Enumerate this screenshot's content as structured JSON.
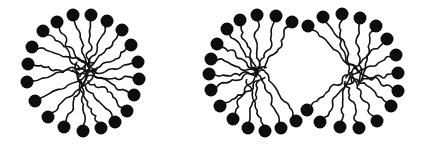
{
  "diagram": {
    "colors": {
      "background": "#ffffff",
      "head": "#0d0d0d",
      "tail": "#111111"
    },
    "head_radius": 6.5,
    "micelles": [
      {
        "name": "spherical-micelle",
        "center": [
          84,
          72
        ],
        "heads": [
          [
            73,
            15
          ],
          [
            91,
            15
          ],
          [
            107,
            21
          ],
          [
            122,
            30
          ],
          [
            131,
            45
          ],
          [
            138,
            62
          ],
          [
            139,
            79
          ],
          [
            134,
            95
          ],
          [
            127,
            111
          ],
          [
            115,
            122
          ],
          [
            101,
            128
          ],
          [
            83,
            131
          ],
          [
            64,
            127
          ],
          [
            48,
            117
          ],
          [
            35,
            101
          ],
          [
            27,
            82
          ],
          [
            28,
            64
          ],
          [
            32,
            47
          ],
          [
            43,
            31
          ],
          [
            57,
            22
          ]
        ]
      },
      {
        "name": "elongated-micelle",
        "centers": [
          [
            258,
            74
          ],
          [
            352,
            74
          ]
        ],
        "heads": [
          [
            240,
            20
          ],
          [
            257,
            15
          ],
          [
            276,
            16
          ],
          [
            292,
            22
          ],
          [
            308,
            26
          ],
          [
            323,
            17
          ],
          [
            342,
            14
          ],
          [
            360,
            18
          ],
          [
            376,
            26
          ],
          [
            387,
            39
          ],
          [
            396,
            55
          ],
          [
            398,
            73
          ],
          [
            398,
            91
          ],
          [
            391,
            106
          ],
          [
            377,
            121
          ],
          [
            359,
            128
          ],
          [
            340,
            127
          ],
          [
            320,
            122
          ],
          [
            307,
            110
          ],
          [
            296,
            121
          ],
          [
            281,
            128
          ],
          [
            265,
            131
          ],
          [
            248,
            128
          ],
          [
            233,
            119
          ],
          [
            220,
            106
          ],
          [
            211,
            90
          ],
          [
            209,
            74
          ],
          [
            211,
            59
          ],
          [
            217,
            44
          ],
          [
            227,
            29
          ]
        ]
      }
    ]
  }
}
